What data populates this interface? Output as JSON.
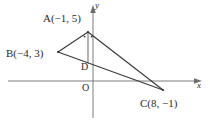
{
  "figure": {
    "name": "coordinate-plane-triangle-diagram",
    "background_color": "#ffffff",
    "stroke_color": "#3a3a3a",
    "axis_color": "#6e6e6e",
    "text_color": "#2b2b2b",
    "axes": {
      "x_label": "x",
      "y_label": "y",
      "origin_label": "O",
      "x_axis_y_px": 81,
      "y_axis_x_px": 93,
      "arrows": true,
      "grid": false
    },
    "points": {
      "A": {
        "label": "A(−1, 5)",
        "x": -1,
        "y": 5,
        "px": 88,
        "py": 32
      },
      "B": {
        "label": "B(−4, 3)",
        "x": -4,
        "y": 3,
        "px": 58,
        "py": 52
      },
      "C": {
        "label": "C(8, −1)",
        "x": 8,
        "y": -1,
        "px": 163,
        "py": 90
      },
      "D": {
        "label": "D",
        "px": 88,
        "py": 66
      }
    },
    "segments": [
      {
        "name": "segment-AB",
        "from": "A",
        "to": "B"
      },
      {
        "name": "segment-AC",
        "from": "A",
        "to": "C"
      },
      {
        "name": "segment-BC",
        "from": "B",
        "to": "C"
      },
      {
        "name": "segment-AD",
        "from": "A",
        "to": "D"
      }
    ],
    "marks": {
      "angle-ticks-at-A": 2
    }
  }
}
